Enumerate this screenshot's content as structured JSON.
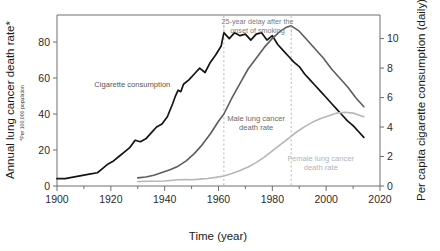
{
  "chart_data": {
    "type": "line",
    "title": "",
    "xlabel": "Time (year)",
    "ylabel": "Annual lung cancer death rate*",
    "ylabel_footnote": "*Per 100,000 population",
    "ylabel_right": "Per capita cigarette consumption (daily)",
    "xlim": [
      1900,
      2020
    ],
    "xticks": [
      1900,
      1920,
      1940,
      1960,
      1980,
      2000,
      2020
    ],
    "xticklabels": [
      "1900",
      "1920",
      "1940",
      "1960",
      "1980",
      "2000",
      "2020"
    ],
    "ylim_left": [
      0,
      95
    ],
    "yticks_left": [
      0,
      20,
      40,
      60,
      80
    ],
    "yticklabels_left": [
      "0",
      "20",
      "40",
      "60",
      "80"
    ],
    "ylim_right": [
      0,
      11.6
    ],
    "yticks_right": [
      0,
      2,
      4,
      6,
      8,
      10
    ],
    "yticklabels_right": [
      "0",
      "2",
      "4",
      "6",
      "8",
      "10"
    ],
    "grid": false,
    "legend_position": "inline-annotations",
    "annotations": [
      {
        "name": "delay-annotation",
        "text_line1": "25-year delay after the",
        "text_line2": "onset of smoking",
        "from_year": 1962,
        "to_year": 1987
      }
    ],
    "guides": [
      {
        "name": "guide-1962",
        "year": 1962,
        "style": "dashed",
        "color": "#b0b0b0"
      },
      {
        "name": "guide-1987",
        "year": 1987,
        "style": "dashed",
        "color": "#b0b0b0"
      }
    ],
    "series": [
      {
        "name": "Cigarette consumption",
        "label": "Cigarette consumption",
        "axis": "right",
        "color": "#141414",
        "width": 1.7,
        "units": "per capita cigarettes per day",
        "x": [
          1900,
          1903,
          1906,
          1909,
          1912,
          1915,
          1917,
          1919,
          1921,
          1923,
          1925,
          1927,
          1929,
          1931,
          1933,
          1935,
          1937,
          1939,
          1941,
          1943,
          1944,
          1945,
          1946,
          1947,
          1949,
          1951,
          1953,
          1955,
          1957,
          1959,
          1961,
          1962,
          1964,
          1966,
          1968,
          1970,
          1972,
          1974,
          1976,
          1978,
          1980,
          1982,
          1984,
          1986,
          1988,
          1990,
          1992,
          1994,
          1996,
          1998,
          2000,
          2002,
          2004,
          2006,
          2008,
          2010,
          2012,
          2014
        ],
        "y": [
          0.5,
          0.5,
          0.6,
          0.7,
          0.8,
          0.9,
          1.2,
          1.5,
          1.7,
          2.0,
          2.3,
          2.6,
          3.1,
          3.0,
          3.2,
          3.6,
          4.0,
          4.2,
          4.7,
          5.6,
          6.1,
          6.5,
          6.4,
          6.9,
          7.2,
          7.6,
          8.0,
          7.7,
          8.4,
          8.9,
          9.5,
          10.4,
          10.0,
          10.4,
          10.2,
          10.3,
          9.9,
          10.3,
          10.4,
          9.9,
          10.2,
          9.6,
          9.2,
          8.8,
          8.4,
          8.1,
          7.6,
          7.2,
          6.8,
          6.4,
          6.0,
          5.6,
          5.2,
          4.8,
          4.4,
          4.1,
          3.7,
          3.3
        ]
      },
      {
        "name": "Male lung cancer death rate",
        "label": "Male lung cancer\ndeath rate",
        "axis": "left",
        "color": "#5d5d5d",
        "width": 1.6,
        "units": "deaths per 100,000 population",
        "x": [
          1930,
          1933,
          1936,
          1939,
          1942,
          1945,
          1948,
          1951,
          1954,
          1957,
          1960,
          1962,
          1965,
          1968,
          1971,
          1974,
          1977,
          1980,
          1983,
          1985,
          1987,
          1990,
          1993,
          1996,
          1999,
          2002,
          2005,
          2008,
          2011,
          2014
        ],
        "y": [
          4.5,
          5.0,
          6.0,
          7.5,
          9.0,
          11.0,
          14.0,
          18.0,
          23.0,
          29.0,
          36.0,
          40.0,
          49.0,
          57.0,
          65.0,
          71.0,
          77.0,
          82.0,
          86.0,
          88.0,
          89.0,
          86.0,
          81.0,
          76.0,
          71.0,
          65.0,
          60.0,
          55.0,
          49.0,
          44.0
        ]
      },
      {
        "name": "Female lung cancer death rate",
        "label": "Female lung cancer\ndeath rate",
        "axis": "left",
        "color": "#b6b6b6",
        "width": 1.6,
        "units": "deaths per 100,000 population",
        "x": [
          1930,
          1935,
          1940,
          1945,
          1948,
          1950,
          1953,
          1956,
          1959,
          1962,
          1965,
          1968,
          1971,
          1974,
          1977,
          1980,
          1983,
          1986,
          1989,
          1992,
          1995,
          1998,
          2001,
          2004,
          2007,
          2010,
          2012,
          2014
        ],
        "y": [
          2.5,
          2.6,
          2.8,
          3.5,
          3.6,
          3.5,
          3.8,
          4.2,
          4.8,
          5.6,
          7.0,
          8.6,
          10.6,
          13.0,
          16.0,
          19.5,
          23.0,
          26.5,
          30.0,
          33.0,
          35.5,
          37.5,
          39.0,
          40.5,
          41.0,
          40.5,
          39.5,
          38.5
        ]
      }
    ],
    "series_label_positions": [
      {
        "name": "Cigarette consumption",
        "year": 1928,
        "value_right": 6.7
      },
      {
        "name": "Male lung cancer death rate",
        "year": 1974,
        "value_left": 36
      },
      {
        "name": "Female lung cancer death rate",
        "year": 1998,
        "value_left": 14
      }
    ]
  }
}
